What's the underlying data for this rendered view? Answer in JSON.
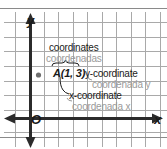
{
  "figure": {
    "type": "coordinate-plane-diagram",
    "axes": {
      "y_label": "y",
      "x_label": "x",
      "origin_label": "O"
    },
    "point": {
      "name_label": "A(1, 3)",
      "name": "A",
      "x": 1,
      "y": 3
    },
    "callouts": {
      "coordinates_en": "coordinates",
      "coordinates_es": "coordenadas",
      "y_coordinate_en": "y-coordinate",
      "y_coordinate_es": "coordenada y",
      "x_coordinate_en": "x-coordinate",
      "x_coordinate_es": "coordenada x"
    },
    "colors": {
      "english_text": "#1a1a1a",
      "spanish_text": "#9a9a9a",
      "axis": "#2b2b2b",
      "grid": "#a9a9a9",
      "rule": "#8a8a8a",
      "background": "#ffffff"
    },
    "grid": {
      "vertical_lines_x": [
        15,
        29,
        44,
        58,
        73,
        87,
        102,
        116,
        131,
        145,
        160
      ],
      "horizontal_lines_y": [
        22,
        37,
        51,
        66,
        81,
        95,
        110,
        118,
        132
      ],
      "spacing_px": 14.5
    },
    "rules": {
      "top_rule_y": 8,
      "bottom_rule_y": 137
    }
  }
}
